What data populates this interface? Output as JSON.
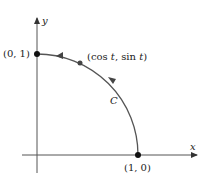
{
  "diagram": {
    "type": "parametric-curve",
    "axes": {
      "x_label": "x",
      "y_label": "y"
    },
    "curve": {
      "name": "C",
      "description": "Quarter unit circle from (1, 0) to (0, 1), counterclockwise",
      "color": "#555555"
    },
    "points": [
      {
        "label": "(0, 1)"
      },
      {
        "label": "(1, 0)"
      }
    ],
    "moving_point": {
      "label_prefix": "(cos ",
      "t1": "t",
      "mid": ", sin ",
      "t2": "t",
      "suffix": ")"
    }
  }
}
